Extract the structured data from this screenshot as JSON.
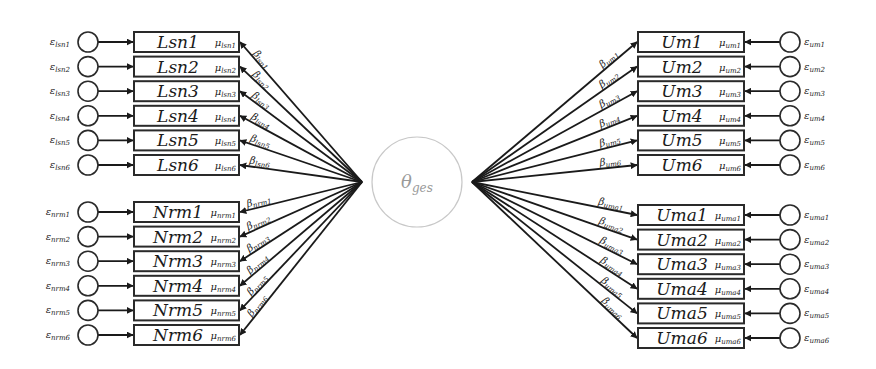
{
  "diagram": {
    "type": "structural-equation-model",
    "latent": {
      "label": "θ",
      "subscript": "ges",
      "cx": 417,
      "cy": 182,
      "r": 45
    },
    "groups": [
      {
        "id": "lsn",
        "side": "left",
        "items": [
          {
            "name": "Lsn1",
            "mu": "μ",
            "mu_sub": "lsn1",
            "eps": "ε",
            "eps_sub": "lsn1",
            "beta": "β",
            "beta_sub": "lsn1"
          },
          {
            "name": "Lsn2",
            "mu": "μ",
            "mu_sub": "lsn2",
            "eps": "ε",
            "eps_sub": "lsn2",
            "beta": "β",
            "beta_sub": "lsn2"
          },
          {
            "name": "Lsn3",
            "mu": "μ",
            "mu_sub": "lsn3",
            "eps": "ε",
            "eps_sub": "lsn3",
            "beta": "β",
            "beta_sub": "lsn3"
          },
          {
            "name": "Lsn4",
            "mu": "μ",
            "mu_sub": "lsn4",
            "eps": "ε",
            "eps_sub": "lsn4",
            "beta": "β",
            "beta_sub": "lsn4"
          },
          {
            "name": "Lsn5",
            "mu": "μ",
            "mu_sub": "lsn5",
            "eps": "ε",
            "eps_sub": "lsn5",
            "beta": "β",
            "beta_sub": "lsn5"
          },
          {
            "name": "Lsn6",
            "mu": "μ",
            "mu_sub": "lsn6",
            "eps": "ε",
            "eps_sub": "lsn6",
            "beta": "β",
            "beta_sub": "lsn6"
          }
        ]
      },
      {
        "id": "nrm",
        "side": "left",
        "items": [
          {
            "name": "Nrm1",
            "mu": "μ",
            "mu_sub": "nrm1",
            "eps": "ε",
            "eps_sub": "nrm1",
            "beta": "β",
            "beta_sub": "nrm1"
          },
          {
            "name": "Nrm2",
            "mu": "μ",
            "mu_sub": "nrm2",
            "eps": "ε",
            "eps_sub": "nrm2",
            "beta": "β",
            "beta_sub": "nrm2"
          },
          {
            "name": "Nrm3",
            "mu": "μ",
            "mu_sub": "nrm3",
            "eps": "ε",
            "eps_sub": "nrm3",
            "beta": "β",
            "beta_sub": "nrm3"
          },
          {
            "name": "Nrm4",
            "mu": "μ",
            "mu_sub": "nrm4",
            "eps": "ε",
            "eps_sub": "nrm4",
            "beta": "β",
            "beta_sub": "nrm4"
          },
          {
            "name": "Nrm5",
            "mu": "μ",
            "mu_sub": "nrm5",
            "eps": "ε",
            "eps_sub": "nrm5",
            "beta": "β",
            "beta_sub": "nrm5"
          },
          {
            "name": "Nrm6",
            "mu": "μ",
            "mu_sub": "nrm6",
            "eps": "ε",
            "eps_sub": "nrm6",
            "beta": "β",
            "beta_sub": "nrm6"
          }
        ]
      },
      {
        "id": "um",
        "side": "right",
        "items": [
          {
            "name": "Um1",
            "mu": "μ",
            "mu_sub": "um1",
            "eps": "ε",
            "eps_sub": "um1",
            "beta": "β",
            "beta_sub": "um1"
          },
          {
            "name": "Um2",
            "mu": "μ",
            "mu_sub": "um2",
            "eps": "ε",
            "eps_sub": "um2",
            "beta": "β",
            "beta_sub": "um2"
          },
          {
            "name": "Um3",
            "mu": "μ",
            "mu_sub": "um3",
            "eps": "ε",
            "eps_sub": "um3",
            "beta": "β",
            "beta_sub": "um3"
          },
          {
            "name": "Um4",
            "mu": "μ",
            "mu_sub": "um4",
            "eps": "ε",
            "eps_sub": "um4",
            "beta": "β",
            "beta_sub": "um4"
          },
          {
            "name": "Um5",
            "mu": "μ",
            "mu_sub": "um5",
            "eps": "ε",
            "eps_sub": "um5",
            "beta": "β",
            "beta_sub": "um5"
          },
          {
            "name": "Um6",
            "mu": "μ",
            "mu_sub": "um6",
            "eps": "ε",
            "eps_sub": "um6",
            "beta": "β",
            "beta_sub": "um6"
          }
        ]
      },
      {
        "id": "uma",
        "side": "right",
        "items": [
          {
            "name": "Uma1",
            "mu": "μ",
            "mu_sub": "uma1",
            "eps": "ε",
            "eps_sub": "uma1",
            "beta": "β",
            "beta_sub": "uma1"
          },
          {
            "name": "Uma2",
            "mu": "μ",
            "mu_sub": "uma2",
            "eps": "ε",
            "eps_sub": "uma2",
            "beta": "β",
            "beta_sub": "uma2"
          },
          {
            "name": "Uma3",
            "mu": "μ",
            "mu_sub": "uma3",
            "eps": "ε",
            "eps_sub": "uma3",
            "beta": "β",
            "beta_sub": "uma3"
          },
          {
            "name": "Uma4",
            "mu": "μ",
            "mu_sub": "uma4",
            "eps": "ε",
            "eps_sub": "uma4",
            "beta": "β",
            "beta_sub": "uma4"
          },
          {
            "name": "Uma5",
            "mu": "μ",
            "mu_sub": "uma5",
            "eps": "ε",
            "eps_sub": "uma5",
            "beta": "β",
            "beta_sub": "uma5"
          },
          {
            "name": "Uma6",
            "mu": "μ",
            "mu_sub": "uma6",
            "eps": "ε",
            "eps_sub": "uma6",
            "beta": "β",
            "beta_sub": "uma6"
          }
        ]
      }
    ],
    "colors": {
      "stroke": "#1a1a1a",
      "latent_stroke": "#c8c8c8",
      "latent_text": "#9a9a9a"
    }
  }
}
